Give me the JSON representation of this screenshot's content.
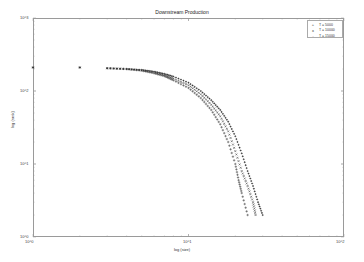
{
  "chart_data": {
    "type": "scatter",
    "title": "Downstream Production",
    "xlabel": "log (size)",
    "ylabel": "log (rank)",
    "xscale": "log",
    "yscale": "log",
    "xlim": [
      1,
      100
    ],
    "ylim": [
      1,
      1000
    ],
    "x_ticks": [
      "10^0",
      "10^1",
      "10^2"
    ],
    "y_ticks": [
      "10^0",
      "10^1",
      "10^2",
      "10^3"
    ],
    "grid": false,
    "legend_position": "upper right",
    "series": [
      {
        "name": "T = 5000",
        "marker": "+",
        "points": [
          [
            1,
            210
          ],
          [
            2,
            210
          ],
          [
            3,
            205
          ],
          [
            4,
            200
          ],
          [
            5,
            190
          ],
          [
            6,
            175
          ],
          [
            7,
            160
          ],
          [
            8,
            140
          ],
          [
            10,
            110
          ],
          [
            12,
            80
          ],
          [
            14,
            55
          ],
          [
            16,
            35
          ],
          [
            18,
            20
          ],
          [
            20,
            10
          ],
          [
            21,
            6
          ],
          [
            22,
            4
          ],
          [
            24,
            2
          ]
        ]
      },
      {
        "name": "T = 10000",
        "marker": "x",
        "points": [
          [
            1,
            210
          ],
          [
            2,
            210
          ],
          [
            3,
            205
          ],
          [
            4,
            200
          ],
          [
            5,
            192
          ],
          [
            6,
            180
          ],
          [
            7,
            165
          ],
          [
            8,
            148
          ],
          [
            10,
            120
          ],
          [
            12,
            90
          ],
          [
            14,
            65
          ],
          [
            16,
            45
          ],
          [
            18,
            28
          ],
          [
            20,
            15
          ],
          [
            22,
            8
          ],
          [
            24,
            5
          ],
          [
            26,
            3
          ],
          [
            27,
            2
          ]
        ]
      },
      {
        "name": "T = 15000",
        "marker": ".",
        "points": [
          [
            1,
            210
          ],
          [
            2,
            210
          ],
          [
            3,
            205
          ],
          [
            4,
            200
          ],
          [
            5,
            195
          ],
          [
            6,
            185
          ],
          [
            7,
            172
          ],
          [
            8,
            158
          ],
          [
            10,
            130
          ],
          [
            12,
            100
          ],
          [
            14,
            75
          ],
          [
            16,
            55
          ],
          [
            18,
            38
          ],
          [
            20,
            24
          ],
          [
            22,
            14
          ],
          [
            24,
            8
          ],
          [
            26,
            5
          ],
          [
            28,
            3
          ],
          [
            30,
            2
          ]
        ]
      }
    ]
  }
}
